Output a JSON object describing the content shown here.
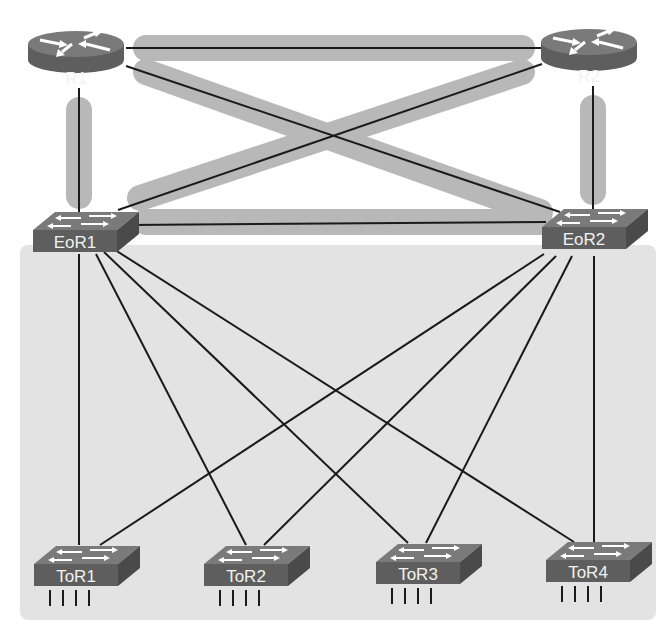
{
  "diagram": {
    "colors": {
      "background": "#ffffff",
      "access_area": "#e3e3e3",
      "highlight_path": "#b8b8b8",
      "link": "#1a1a1a",
      "device_top": "#7a7a7a",
      "device_front": "#5e5e5e",
      "device_side": "#4a4a4a",
      "label_text": "#f2f2f2"
    },
    "routers": [
      {
        "id": "R1",
        "label": "R1"
      },
      {
        "id": "R2",
        "label": "R2"
      }
    ],
    "eor_switches": [
      {
        "id": "EoR1",
        "label": "EoR1"
      },
      {
        "id": "EoR2",
        "label": "EoR2"
      }
    ],
    "tor_switches": [
      {
        "id": "ToR1",
        "label": "ToR1"
      },
      {
        "id": "ToR2",
        "label": "ToR2"
      },
      {
        "id": "ToR3",
        "label": "ToR3"
      },
      {
        "id": "ToR4",
        "label": "ToR4"
      }
    ],
    "links": [
      [
        "R1",
        "R2"
      ],
      [
        "R1",
        "EoR1"
      ],
      [
        "R1",
        "EoR2"
      ],
      [
        "R2",
        "EoR1"
      ],
      [
        "R2",
        "EoR2"
      ],
      [
        "EoR1",
        "EoR2"
      ],
      [
        "EoR1",
        "ToR1"
      ],
      [
        "EoR1",
        "ToR2"
      ],
      [
        "EoR1",
        "ToR3"
      ],
      [
        "EoR1",
        "ToR4"
      ],
      [
        "EoR2",
        "ToR1"
      ],
      [
        "EoR2",
        "ToR2"
      ],
      [
        "EoR2",
        "ToR3"
      ],
      [
        "EoR2",
        "ToR4"
      ]
    ],
    "highlighted_links": [
      [
        "R1",
        "R2"
      ],
      [
        "R1",
        "EoR1"
      ],
      [
        "R1",
        "EoR2"
      ],
      [
        "R2",
        "EoR1"
      ],
      [
        "R2",
        "EoR2"
      ],
      [
        "EoR1",
        "EoR2"
      ]
    ]
  }
}
